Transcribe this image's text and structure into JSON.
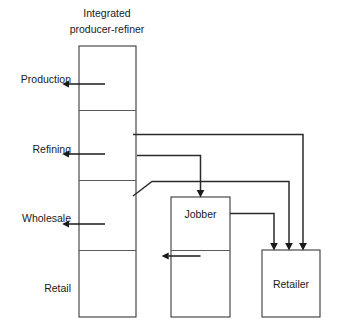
{
  "diagram": {
    "title_line1": "Integrated",
    "title_line2": "producer-refiner",
    "stage_labels": [
      {
        "id": "production",
        "text": "Production"
      },
      {
        "id": "refining",
        "text": "Refining"
      },
      {
        "id": "wholesale",
        "text": "Wholesale"
      },
      {
        "id": "retail",
        "text": "Retail"
      }
    ],
    "nodes": [
      {
        "id": "integrated-producer-refiner",
        "label": ""
      },
      {
        "id": "jobber",
        "label": "Jobber"
      },
      {
        "id": "retailer",
        "label": "Retailer"
      }
    ],
    "node_labels": {
      "jobber": "Jobber",
      "retailer": "Retailer"
    },
    "colors": {
      "background": "#ffffff",
      "box_stroke": "#3a3a3a",
      "divider_stroke": "#5a5a5a",
      "flow_stroke": "#2b2b2b",
      "text": "#1a1a1a"
    },
    "flows": [
      {
        "id": "refining-to-retailer-direct",
        "from": "refining",
        "to": "retailer"
      },
      {
        "id": "refining-to-jobber",
        "from": "refining",
        "to": "jobber"
      },
      {
        "id": "wholesale-to-retailer",
        "from": "wholesale",
        "to": "retailer"
      },
      {
        "id": "jobber-to-retailer",
        "from": "jobber",
        "to": "retailer"
      }
    ]
  }
}
